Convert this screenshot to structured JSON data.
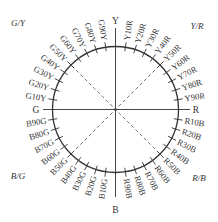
{
  "diagram": {
    "center": {
      "x": 115.5,
      "y": 109.5
    },
    "radius": 63,
    "line_color": "#333333",
    "dashed_color": "#555555",
    "primaries": [
      {
        "label": "Y",
        "angle": 90
      },
      {
        "label": "R",
        "angle": 0
      },
      {
        "label": "B",
        "angle": -90
      },
      {
        "label": "G",
        "angle": 180
      }
    ],
    "corner_labels": {
      "top_left": "G/Y",
      "top_right": "Y/R",
      "bottom_left": "B/G",
      "bottom_right": "R/B"
    },
    "hues": [
      "Y10R",
      "Y20R",
      "Y30R",
      "Y40R",
      "Y50R",
      "Y60R",
      "Y70R",
      "Y80R",
      "Y90R",
      "R10B",
      "R20B",
      "R30B",
      "R40B",
      "R50B",
      "R60B",
      "R70B",
      "R80B",
      "R90B",
      "B10G",
      "B20G",
      "B30G",
      "B40G",
      "B50G",
      "B60G",
      "B70G",
      "B80G",
      "B90G",
      "G10Y",
      "G20Y",
      "G30Y",
      "G40Y",
      "G50Y",
      "G60Y",
      "G70Y",
      "G80Y",
      "G90Y"
    ]
  }
}
